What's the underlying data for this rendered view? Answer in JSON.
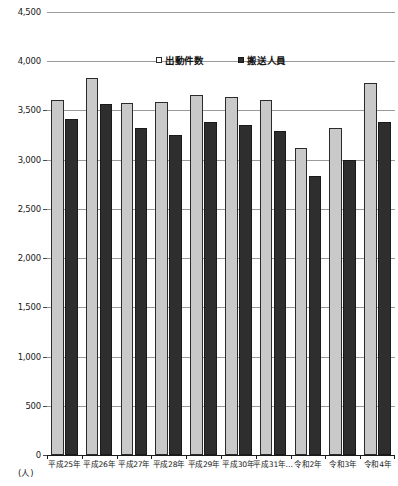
{
  "chart_data": {
    "type": "bar",
    "title": "",
    "xlabel": "",
    "ylabel": "",
    "yunit": "(人)",
    "ylim": [
      0,
      4500
    ],
    "ytick_step": 500,
    "ytick_labels": [
      "4,500",
      "4,000",
      "3,500",
      "3,000",
      "2,500",
      "2,000",
      "1,500",
      "1,000",
      "500",
      "0"
    ],
    "ytick_values": [
      4500,
      4000,
      3500,
      3000,
      2500,
      2000,
      1500,
      1000,
      500,
      0
    ],
    "grid": true,
    "legend_position": "top-center",
    "categories": [
      "平成25年",
      "平成26年",
      "平成27年",
      "平成28年",
      "平成29年",
      "平成30年",
      "平成31年…",
      "令和2年",
      "令和3年",
      "令和4年"
    ],
    "series": [
      {
        "name": "出動件数",
        "color": "#c9c9c9",
        "values": [
          3610,
          3830,
          3580,
          3590,
          3660,
          3640,
          3610,
          3120,
          3320,
          3780
        ]
      },
      {
        "name": "搬送人員",
        "color": "#2e2e2e",
        "values": [
          3410,
          3570,
          3320,
          3250,
          3380,
          3350,
          3290,
          2830,
          3000,
          3380
        ]
      }
    ]
  }
}
